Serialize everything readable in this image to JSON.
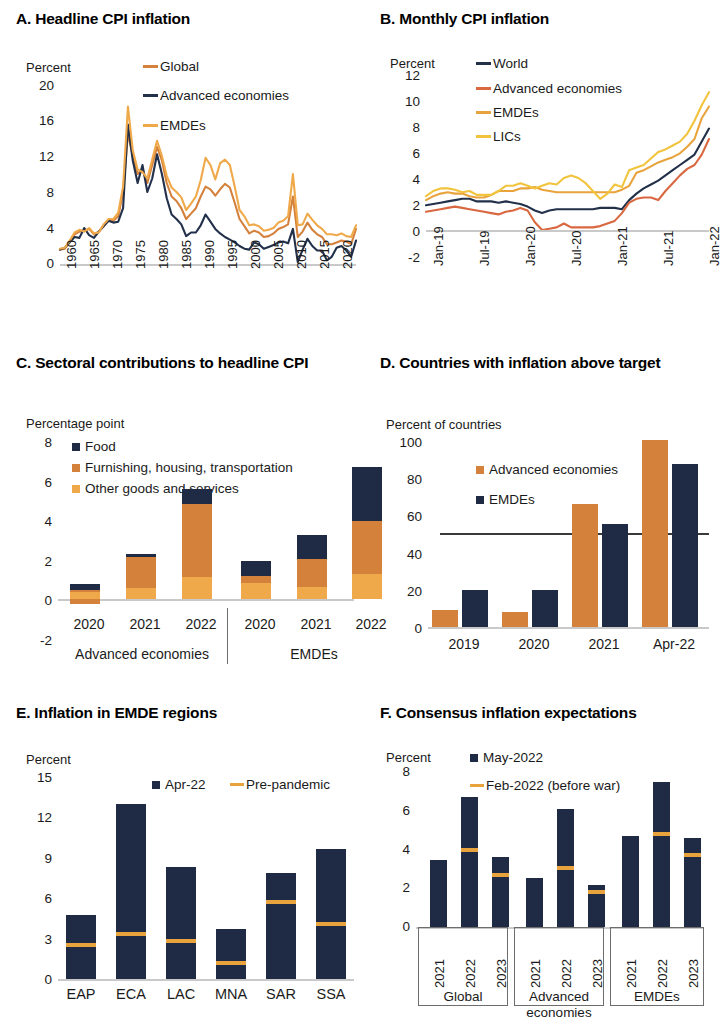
{
  "colors": {
    "navy": "#22304a",
    "dark_navy": "#1f2b44",
    "orange": "#d4813c",
    "light_orange": "#f0a94a",
    "gold": "#f2c33c",
    "coral": "#d9673f",
    "axis": "#c9c9c9",
    "text": "#1a1a1a"
  },
  "panels": {
    "a": {
      "title": "A. Headline CPI inflation",
      "unit": "Percent",
      "legend": [
        {
          "label": "Global",
          "color": "#d4813c"
        },
        {
          "label": "Advanced economies",
          "color": "#22304a"
        },
        {
          "label": "EMDEs",
          "color": "#f0a94a"
        }
      ],
      "yticks": [
        "20",
        "16",
        "12",
        "8",
        "4",
        "0"
      ],
      "xticks": [
        "1960",
        "1965",
        "1970",
        "1975",
        "1980",
        "1985",
        "1990",
        "1995",
        "2000",
        "2005",
        "2010",
        "2015",
        "2020"
      ]
    },
    "b": {
      "title": "B. Monthly CPI inflation",
      "unit": "Percent",
      "legend": [
        {
          "label": "World",
          "color": "#22304a"
        },
        {
          "label": "Advanced economies",
          "color": "#d9673f"
        },
        {
          "label": "EMDEs",
          "color": "#e8a33d"
        },
        {
          "label": "LICs",
          "color": "#f2c33c"
        }
      ],
      "yticks": [
        "12",
        "10",
        "8",
        "6",
        "4",
        "2",
        "0",
        "-2"
      ],
      "xticks": [
        "Jan-19",
        "Jul-19",
        "Jan-20",
        "Jul-20",
        "Jan-21",
        "Jul-21",
        "Jan-22"
      ]
    },
    "c": {
      "title": "C. Sectoral contributions to headline CPI",
      "unit": "Percentage point",
      "legend": [
        {
          "label": "Food",
          "color": "#1f2b44"
        },
        {
          "label": "Furnishing, housing, transportation",
          "color": "#d4813c"
        },
        {
          "label": "Other goods and services",
          "color": "#f0a94a"
        }
      ],
      "yticks": [
        "8",
        "6",
        "4",
        "2",
        "0",
        "-2"
      ],
      "xticks": [
        "2020",
        "2021",
        "2022",
        "2020",
        "2021",
        "2022"
      ],
      "groups": [
        "Advanced economies",
        "EMDEs"
      ]
    },
    "d": {
      "title": "D. Countries with inflation above target",
      "unit": "Percent of countries",
      "legend": [
        {
          "label": "Advanced economies",
          "color": "#d4813c"
        },
        {
          "label": "EMDEs",
          "color": "#1f2b44"
        }
      ],
      "yticks": [
        "100",
        "80",
        "60",
        "40",
        "20",
        "0"
      ],
      "xticks": [
        "2019",
        "2020",
        "2021",
        "Apr-22"
      ]
    },
    "e": {
      "title": "E. Inflation in EMDE regions",
      "unit": "Percent",
      "legend": [
        {
          "label": "Apr-22",
          "color": "#1f2b44",
          "kind": "square"
        },
        {
          "label": "Pre-pandemic",
          "color": "#e8a33d",
          "kind": "line"
        }
      ],
      "yticks": [
        "15",
        "12",
        "9",
        "6",
        "3",
        "0"
      ],
      "xticks": [
        "EAP",
        "ECA",
        "LAC",
        "MNA",
        "SAR",
        "SSA"
      ]
    },
    "f": {
      "title": "F. Consensus inflation expectations",
      "unit": "Percent",
      "legend": [
        {
          "label": "May-2022",
          "color": "#1f2b44",
          "kind": "square"
        },
        {
          "label": "Feb-2022 (before war)",
          "color": "#e8a33d",
          "kind": "line"
        }
      ],
      "yticks": [
        "8",
        "6",
        "4",
        "2",
        "0"
      ],
      "xticks": [
        "2021",
        "2022",
        "2023",
        "2021",
        "2022",
        "2023",
        "2021",
        "2022",
        "2023"
      ],
      "groups": [
        "Global",
        "Advanced economies",
        "EMDEs"
      ]
    }
  },
  "chart_data": [
    {
      "id": "a",
      "type": "line",
      "title": "A. Headline CPI inflation",
      "ylabel": "Percent",
      "xlabel": "",
      "ylim": [
        0,
        20
      ],
      "xlim": [
        1960,
        2022
      ],
      "grid": false,
      "legend_position": "top-center",
      "x": [
        1960,
        1961,
        1962,
        1963,
        1964,
        1965,
        1966,
        1967,
        1968,
        1969,
        1970,
        1971,
        1972,
        1973,
        1974,
        1975,
        1976,
        1977,
        1978,
        1979,
        1980,
        1981,
        1982,
        1983,
        1984,
        1985,
        1986,
        1987,
        1988,
        1989,
        1990,
        1991,
        1992,
        1993,
        1994,
        1995,
        1996,
        1997,
        1998,
        1999,
        2000,
        2001,
        2002,
        2003,
        2004,
        2005,
        2006,
        2007,
        2008,
        2009,
        2010,
        2011,
        2012,
        2013,
        2014,
        2015,
        2016,
        2017,
        2018,
        2019,
        2020,
        2021
      ],
      "series": [
        {
          "name": "Global",
          "color": "#d4813c",
          "values": [
            1.6,
            1.7,
            2.5,
            3.3,
            3.6,
            3.7,
            3.9,
            3.3,
            3.6,
            4.3,
            4.9,
            4.8,
            5.3,
            8.0,
            14.5,
            12.0,
            10.0,
            10.5,
            9.0,
            11.0,
            13.0,
            11.5,
            9.0,
            7.5,
            7.0,
            6.2,
            5.0,
            5.6,
            6.2,
            7.5,
            8.6,
            8.3,
            7.6,
            8.3,
            8.9,
            8.5,
            6.8,
            5.0,
            4.2,
            3.4,
            3.7,
            3.5,
            3.0,
            3.1,
            3.4,
            3.9,
            4.1,
            4.4,
            7.5,
            3.0,
            3.6,
            4.6,
            3.8,
            3.3,
            3.0,
            2.2,
            2.2,
            2.4,
            2.6,
            2.5,
            2.2,
            3.9
          ]
        },
        {
          "name": "Advanced economies",
          "color": "#22304a",
          "values": [
            1.6,
            1.8,
            2.4,
            3.0,
            2.9,
            4.0,
            3.2,
            2.9,
            3.6,
            4.2,
            4.8,
            4.6,
            4.7,
            6.2,
            15.5,
            11.5,
            9.0,
            11.0,
            8.0,
            9.5,
            12.2,
            10.0,
            7.3,
            5.5,
            5.0,
            4.4,
            3.1,
            3.5,
            3.5,
            4.3,
            5.5,
            4.7,
            3.9,
            3.4,
            3.0,
            2.7,
            2.4,
            2.0,
            1.7,
            1.6,
            2.4,
            2.2,
            1.7,
            1.9,
            2.1,
            2.4,
            2.5,
            2.3,
            3.9,
            0.2,
            1.6,
            2.8,
            2.0,
            1.5,
            1.5,
            0.4,
            0.8,
            1.8,
            2.0,
            1.5,
            0.8,
            2.6
          ]
        },
        {
          "name": "EMDEs",
          "color": "#f0a94a",
          "values": [
            1.7,
            1.8,
            2.6,
            3.5,
            3.8,
            3.6,
            4.0,
            3.4,
            3.5,
            4.4,
            5.0,
            5.0,
            5.7,
            8.6,
            17.5,
            12.6,
            10.5,
            10.2,
            9.5,
            11.6,
            13.7,
            12.0,
            9.8,
            8.5,
            8.0,
            7.4,
            6.0,
            6.7,
            7.5,
            9.3,
            11.8,
            11.0,
            9.4,
            11.2,
            11.6,
            11.0,
            8.6,
            6.0,
            5.3,
            4.3,
            4.4,
            4.2,
            3.7,
            3.8,
            4.0,
            4.6,
            4.8,
            5.3,
            10.0,
            4.3,
            4.4,
            5.6,
            4.9,
            4.3,
            3.9,
            3.3,
            3.3,
            3.2,
            3.4,
            3.1,
            3.0,
            4.3
          ]
        }
      ]
    },
    {
      "id": "b",
      "type": "line",
      "title": "B. Monthly CPI inflation",
      "ylabel": "Percent",
      "xlabel": "",
      "ylim": [
        -2,
        12
      ],
      "grid": false,
      "legend_position": "top-center",
      "x": [
        "Jan-19",
        "Feb-19",
        "Mar-19",
        "Apr-19",
        "May-19",
        "Jun-19",
        "Jul-19",
        "Aug-19",
        "Sep-19",
        "Oct-19",
        "Nov-19",
        "Dec-19",
        "Jan-20",
        "Feb-20",
        "Mar-20",
        "Apr-20",
        "May-20",
        "Jun-20",
        "Jul-20",
        "Aug-20",
        "Sep-20",
        "Oct-20",
        "Nov-20",
        "Dec-20",
        "Jan-21",
        "Feb-21",
        "Mar-21",
        "Apr-21",
        "May-21",
        "Jun-21",
        "Jul-21",
        "Aug-21",
        "Sep-21",
        "Oct-21",
        "Nov-21",
        "Dec-21",
        "Jan-22",
        "Feb-22",
        "Mar-22",
        "Apr-22"
      ],
      "series": [
        {
          "name": "World",
          "color": "#22304a",
          "values": [
            1.9,
            2.0,
            2.1,
            2.2,
            2.3,
            2.4,
            2.4,
            2.2,
            2.2,
            2.2,
            2.1,
            2.2,
            2.1,
            2.0,
            1.8,
            1.5,
            1.3,
            1.5,
            1.6,
            1.6,
            1.6,
            1.6,
            1.6,
            1.6,
            1.7,
            1.7,
            1.7,
            1.6,
            2.3,
            2.8,
            3.2,
            3.5,
            3.8,
            4.2,
            4.6,
            5.0,
            5.4,
            5.8,
            6.8,
            7.8
          ]
        },
        {
          "name": "Advanced economies",
          "color": "#d9673f",
          "values": [
            1.4,
            1.5,
            1.6,
            1.7,
            1.8,
            1.7,
            1.6,
            1.5,
            1.4,
            1.3,
            1.2,
            1.4,
            1.5,
            1.7,
            1.5,
            0.6,
            0.0,
            0.1,
            0.2,
            0.5,
            0.2,
            0.2,
            0.2,
            0.2,
            0.3,
            0.5,
            0.7,
            1.3,
            2.1,
            2.4,
            2.5,
            2.5,
            2.3,
            3.0,
            3.6,
            4.2,
            4.7,
            5.0,
            5.8,
            7.0
          ]
        },
        {
          "name": "EMDEs",
          "color": "#e8a33d",
          "values": [
            2.3,
            2.6,
            2.8,
            2.9,
            2.8,
            2.8,
            2.6,
            2.5,
            2.5,
            2.7,
            3.0,
            3.0,
            3.0,
            3.2,
            3.2,
            3.3,
            3.1,
            3.0,
            2.9,
            2.9,
            2.9,
            2.9,
            2.9,
            2.9,
            2.9,
            2.9,
            2.9,
            3.1,
            3.4,
            4.4,
            4.6,
            4.9,
            5.2,
            5.4,
            5.6,
            5.9,
            6.4,
            7.0,
            8.6,
            9.5
          ]
        },
        {
          "name": "LICs",
          "color": "#f2c33c",
          "values": [
            2.6,
            3.0,
            3.2,
            3.2,
            3.1,
            2.9,
            3.0,
            2.7,
            2.7,
            2.7,
            3.0,
            3.4,
            3.4,
            3.6,
            3.4,
            3.2,
            3.4,
            3.6,
            3.5,
            4.0,
            4.2,
            4.0,
            3.6,
            3.0,
            2.4,
            2.8,
            3.5,
            3.3,
            4.6,
            4.8,
            5.0,
            5.5,
            6.0,
            6.2,
            6.5,
            6.8,
            7.4,
            8.4,
            9.6,
            10.6
          ]
        }
      ]
    },
    {
      "id": "c",
      "type": "bar",
      "subtype": "stacked",
      "title": "C. Sectoral contributions to headline CPI",
      "ylabel": "Percentage point",
      "xlabel": "",
      "ylim": [
        -2,
        8
      ],
      "grid": false,
      "categories": [
        "2020",
        "2021",
        "2022",
        "2020",
        "2021",
        "2022"
      ],
      "groups": [
        "Advanced economies",
        "Advanced economies",
        "Advanced economies",
        "EMDEs",
        "EMDEs",
        "EMDEs"
      ],
      "series": [
        {
          "name": "Other goods and services",
          "color": "#f0a94a",
          "values": [
            0.35,
            0.55,
            1.1,
            0.8,
            0.6,
            1.25
          ]
        },
        {
          "name": "Furnishing, housing, transportation",
          "color": "#d4813c",
          "values": [
            0.1,
            1.55,
            3.7,
            0.35,
            1.4,
            2.65
          ]
        },
        {
          "name": "Food",
          "color": "#1f2b44",
          "values": [
            0.3,
            0.15,
            0.75,
            0.75,
            1.2,
            2.75
          ]
        },
        {
          "name": "Negative contribution",
          "color": "#d4813c",
          "values": [
            -0.25,
            0,
            0,
            0,
            0,
            0
          ]
        }
      ],
      "totals": [
        0.75,
        2.25,
        5.55,
        1.9,
        3.2,
        6.65
      ]
    },
    {
      "id": "d",
      "type": "bar",
      "subtype": "grouped",
      "title": "D. Countries with inflation above target",
      "ylabel": "Percent of countries",
      "xlabel": "",
      "ylim": [
        0,
        100
      ],
      "grid": false,
      "reference_line": 50,
      "categories": [
        "2019",
        "2020",
        "2021",
        "Apr-22"
      ],
      "series": [
        {
          "name": "Advanced economies",
          "color": "#d4813c",
          "values": [
            9,
            8,
            66,
            100
          ]
        },
        {
          "name": "EMDEs",
          "color": "#1f2b44",
          "values": [
            20,
            20,
            55,
            87
          ]
        }
      ]
    },
    {
      "id": "e",
      "type": "bar",
      "title": "E. Inflation in EMDE regions",
      "ylabel": "Percent",
      "xlabel": "",
      "ylim": [
        0,
        15
      ],
      "grid": false,
      "categories": [
        "EAP",
        "ECA",
        "LAC",
        "MNA",
        "SAR",
        "SSA"
      ],
      "series": [
        {
          "name": "Apr-22",
          "color": "#1f2b44",
          "values": [
            4.7,
            12.9,
            8.3,
            3.7,
            7.8,
            9.6
          ]
        },
        {
          "name": "Pre-pandemic",
          "color": "#e8a33d",
          "kind": "marker",
          "values": [
            2.5,
            3.3,
            2.8,
            1.2,
            5.7,
            4.1
          ]
        }
      ]
    },
    {
      "id": "f",
      "type": "bar",
      "title": "F. Consensus inflation expectations",
      "ylabel": "Percent",
      "xlabel": "",
      "ylim": [
        0,
        8
      ],
      "grid": false,
      "categories": [
        "2021",
        "2022",
        "2023",
        "2021",
        "2022",
        "2023",
        "2021",
        "2022",
        "2023"
      ],
      "groups": [
        "Global",
        "Advanced economies",
        "EMDEs"
      ],
      "series": [
        {
          "name": "May-2022",
          "color": "#1f2b44",
          "values": [
            3.4,
            6.6,
            3.55,
            2.5,
            6.0,
            2.15,
            4.65,
            7.4,
            4.55
          ]
        },
        {
          "name": "Feb-2022 (before war)",
          "color": "#e8a33d",
          "kind": "marker",
          "values": [
            null,
            3.9,
            2.65,
            null,
            3.0,
            1.8,
            null,
            4.75,
            3.65
          ]
        }
      ]
    }
  ]
}
